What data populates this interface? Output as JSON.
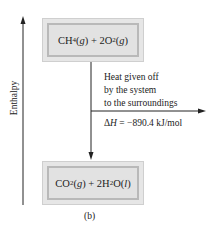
{
  "diagram": {
    "axis_label": "Enthalpy",
    "reactants": {
      "parts": [
        "CH",
        "4",
        "(",
        "g",
        ") + 2O",
        "2",
        "(",
        "g",
        ")"
      ]
    },
    "products": {
      "parts": [
        "CO",
        "2",
        "(",
        "g",
        ") + 2H",
        "2",
        "O(",
        "l",
        ")"
      ]
    },
    "annotation": {
      "line1": "Heat given off",
      "line2": "by the system",
      "line3": "to the surroundings",
      "delta_symbol": "Δ",
      "delta_var": "H",
      "delta_value": " = −890.4 kJ/mol"
    },
    "caption": "(b)",
    "colors": {
      "line": "#222222",
      "box_fill": "#e4e4e4",
      "box_border": "#b9b9b9"
    }
  }
}
